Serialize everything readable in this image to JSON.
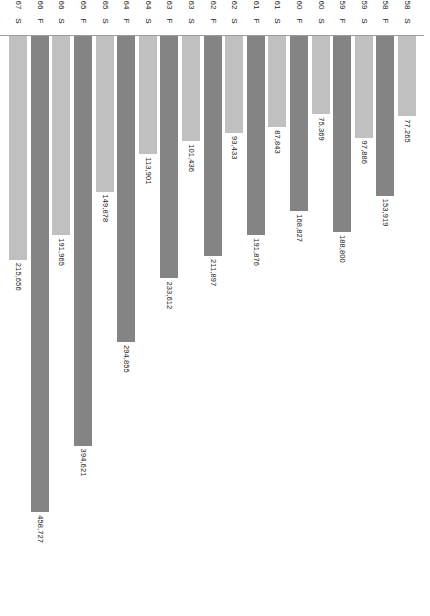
{
  "chart_data": {
    "type": "bar",
    "orientation": "horizontal-rotated",
    "title": "",
    "subtitle": "",
    "xlabel": "",
    "ylabel": "",
    "value_axis": {
      "min": 0,
      "max": 500,
      "ticks": [
        0,
        50,
        100,
        150,
        200,
        250,
        300,
        350,
        400,
        450,
        500
      ],
      "tick_labels": [
        "0",
        "50",
        "100",
        "150",
        "200",
        "250",
        "300",
        "350",
        "400",
        "450",
        "500"
      ],
      "units": "thousands",
      "grid": false,
      "direction": "right-to-left"
    },
    "legend": {
      "position": "none",
      "entries": []
    },
    "categories": [
      {
        "term": "S",
        "year": "58"
      },
      {
        "term": "F",
        "year": "58"
      },
      {
        "term": "S",
        "year": "59"
      },
      {
        "term": "F",
        "year": "59"
      },
      {
        "term": "S",
        "year": "60"
      },
      {
        "term": "F",
        "year": "60"
      },
      {
        "term": "S",
        "year": "61"
      },
      {
        "term": "F",
        "year": "61"
      },
      {
        "term": "S",
        "year": "62"
      },
      {
        "term": "F",
        "year": "62"
      },
      {
        "term": "S",
        "year": "63"
      },
      {
        "term": "F",
        "year": "63"
      },
      {
        "term": "S",
        "year": "64"
      },
      {
        "term": "F",
        "year": "64"
      },
      {
        "term": "S",
        "year": "65"
      },
      {
        "term": "F",
        "year": "65"
      },
      {
        "term": "S",
        "year": "66"
      },
      {
        "term": "F",
        "year": "66"
      },
      {
        "term": "S",
        "year": "67"
      }
    ],
    "bars": [
      {
        "term": "S",
        "year": "58",
        "value": 77265,
        "label": "77,265",
        "series": "Spring"
      },
      {
        "term": "F",
        "year": "58",
        "value": 153919,
        "label": "153,919",
        "series": "Fall"
      },
      {
        "term": "S",
        "year": "59",
        "value": 97886,
        "label": "97,886",
        "series": "Spring"
      },
      {
        "term": "F",
        "year": "59",
        "value": 188800,
        "label": "188,800",
        "series": "Fall"
      },
      {
        "term": "S",
        "year": "60",
        "value": 75369,
        "label": "75,369",
        "series": "Spring"
      },
      {
        "term": "F",
        "year": "60",
        "value": 168827,
        "label": "168,827",
        "series": "Fall"
      },
      {
        "term": "S",
        "year": "61",
        "value": 87843,
        "label": "87,843",
        "series": "Spring"
      },
      {
        "term": "F",
        "year": "61",
        "value": 191876,
        "label": "191,876",
        "series": "Fall"
      },
      {
        "term": "S",
        "year": "62",
        "value": 93433,
        "label": "93,433",
        "series": "Spring"
      },
      {
        "term": "F",
        "year": "62",
        "value": 211897,
        "label": "211,897",
        "series": "Fall"
      },
      {
        "term": "S",
        "year": "63",
        "value": 101436,
        "label": "101,436",
        "series": "Spring"
      },
      {
        "term": "F",
        "year": "63",
        "value": 233612,
        "label": "233,612",
        "series": "Fall"
      },
      {
        "term": "S",
        "year": "64",
        "value": 113901,
        "label": "113,901",
        "series": "Spring"
      },
      {
        "term": "F",
        "year": "64",
        "value": 294855,
        "label": "294,855",
        "series": "Fall"
      },
      {
        "term": "S",
        "year": "65",
        "value": 149878,
        "label": "149,878",
        "series": "Spring"
      },
      {
        "term": "F",
        "year": "65",
        "value": 394621,
        "label": "394,621",
        "series": "Fall"
      },
      {
        "term": "S",
        "year": "66",
        "value": 191965,
        "label": "191,965",
        "series": "Spring"
      },
      {
        "term": "F",
        "year": "66",
        "value": 458727,
        "label": "458,727",
        "series": "Fall"
      },
      {
        "term": "S",
        "year": "67",
        "value": 215656,
        "label": "215,656",
        "series": "Spring"
      }
    ],
    "colors": {
      "fall_bar": "#848484",
      "spring_bar": "#c0c0c0",
      "axis": "#8f8f8f",
      "text": "#1a1a1a",
      "background": "#ffffff"
    }
  }
}
